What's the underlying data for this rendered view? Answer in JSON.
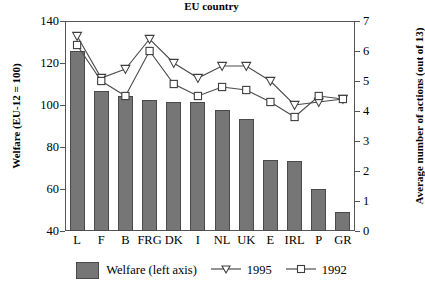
{
  "chart_data": {
    "type": "bar",
    "title": "",
    "xlabel": "EU country",
    "ylabel": "Welfare (EU-12 = 100)",
    "ylabel_right": "Average number of actions (out of 13)",
    "categories": [
      "L",
      "F",
      "B",
      "FRG",
      "DK",
      "I",
      "NL",
      "UK",
      "E",
      "IRL",
      "P",
      "GR"
    ],
    "ylim": [
      40,
      140
    ],
    "yticks": [
      40,
      60,
      80,
      100,
      120,
      140
    ],
    "ylim_right": [
      0,
      7
    ],
    "yticks_right": [
      0,
      1,
      2,
      3,
      4,
      5,
      6,
      7
    ],
    "grid": false,
    "legend_position": "bottom",
    "series": [
      {
        "name": "Welfare (left axis)",
        "type": "bar",
        "axis": "left",
        "color": "#767676",
        "values": [
          125.5,
          106.5,
          104.5,
          102.5,
          101.5,
          101.5,
          97.5,
          93.5,
          74.0,
          73.5,
          60.0,
          49.0
        ]
      },
      {
        "name": "1995",
        "type": "line",
        "axis": "right",
        "marker": "triangle-down",
        "values": [
          6.5,
          5.1,
          5.4,
          6.4,
          5.6,
          5.1,
          5.5,
          5.5,
          5.0,
          4.2,
          4.3,
          4.4
        ]
      },
      {
        "name": "1992",
        "type": "line",
        "axis": "right",
        "marker": "square",
        "values": [
          6.2,
          5.0,
          4.5,
          6.0,
          4.9,
          4.5,
          4.8,
          4.7,
          4.3,
          3.8,
          4.5,
          4.4
        ]
      }
    ]
  },
  "legend": {
    "bar_label": "Welfare (left axis)",
    "series1_label": "1995",
    "series2_label": "1992"
  },
  "axes": {
    "left_title": "Welfare (EU-12 = 100)",
    "right_title": "Average number of actions (out of 13)",
    "x_title": "EU country"
  }
}
